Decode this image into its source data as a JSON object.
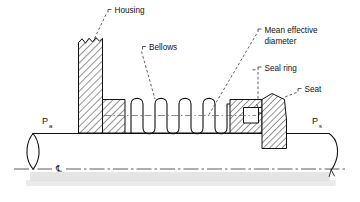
{
  "figure": {
    "background_color": "#ffffff",
    "line_color": "#111111",
    "width": 360,
    "height": 202
  },
  "labels": {
    "housing": "Housing",
    "bellows": "Bellows",
    "mean_effective_diameter_line1": "Mean effective",
    "mean_effective_diameter_line2": "diameter",
    "seal_ring": "Seal ring",
    "seat": "Seat",
    "pressure_ambient_symbol": "P",
    "pressure_ambient_subscript": "a",
    "pressure_sealed_symbol": "P",
    "pressure_sealed_subscript": "s",
    "centerline_symbol": "℄"
  },
  "components": {
    "housing": {
      "name": "Housing",
      "style": "cross-hatched",
      "note": "tall stepped block with jagged break at top"
    },
    "bellows": {
      "name": "Bellows",
      "style": "outline",
      "convolutions": 4
    },
    "seal_ring": {
      "name": "Seal ring",
      "style": "white inset rectangle"
    },
    "seat": {
      "name": "Seat",
      "style": "cross-hatched trapezoid"
    },
    "shaft": {
      "name": "Shaft",
      "style": "outline with break ellipse at left and break curve at right"
    }
  },
  "annotations": {
    "centerline_label": "Centerline of shaft",
    "mean_effective_diameter_indicator": "dash-dot line through bellows"
  }
}
